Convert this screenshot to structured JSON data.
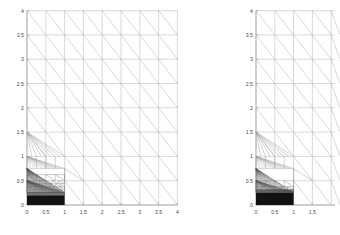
{
  "figure": {
    "kind": "mesh-plot-pair",
    "background": "#ffffff",
    "axis_color": "#8c8c8c",
    "mesh_color": "#b0b0b0",
    "refined_color": "#121212"
  },
  "chart_data": [
    {
      "id": "left",
      "type": "line",
      "title": "",
      "xlabel": "",
      "ylabel": "",
      "xlim": [
        0,
        4
      ],
      "ylim": [
        0,
        4
      ],
      "xticks": [
        0,
        0.5,
        1,
        1.5,
        2,
        2.5,
        3,
        3.5,
        4
      ],
      "xticklabels": [
        "0",
        "0.5",
        "1",
        "1.5",
        "2",
        "2.5",
        "3",
        "3.5",
        "4"
      ],
      "yticks": [
        0,
        0.5,
        1,
        1.5,
        2,
        2.5,
        3,
        3.5,
        4
      ],
      "yticklabels": [
        "0",
        "0.5",
        "1",
        "1.5",
        "2",
        "2.5",
        "3",
        "3.5",
        "4"
      ],
      "grid": false,
      "legend": "none",
      "description": "Adaptively refined triangular finite-element mesh on the square [0,4]x[0,4]. Uniform 0.5x0.5 triangulation with one diagonal per cell away from the boundary layer; strong anisotropic refinement concentrated in the strip 0<=x<=1, 0<=y<=0.75 where element layers accumulate toward y=0 and appear solid black.",
      "coarse_cell": 0.5,
      "diagonal_direction": "top-left to bottom-right",
      "refinement_region": {
        "x": [
          0,
          1
        ],
        "y": [
          0,
          0.75
        ]
      },
      "fan_vertices": [
        [
          0,
          1.5
        ],
        [
          0,
          1.0
        ],
        [
          0,
          0.75
        ]
      ],
      "layer_y_values": [
        0.75,
        0.625,
        0.5,
        0.4375,
        0.375,
        0.3125,
        0.25,
        0.1875,
        0.125,
        0.0625,
        0.03125,
        0.0156,
        0.0078,
        0
      ],
      "solid_band_y": [
        0,
        0.2
      ],
      "refinement_levels": 11
    },
    {
      "id": "right",
      "type": "line",
      "title": "",
      "xlabel": "",
      "ylabel": "",
      "xlim": [
        0,
        2.1
      ],
      "ylim": [
        0,
        4
      ],
      "xticks": [
        0,
        0.5,
        1,
        1.5
      ],
      "xticklabels": [
        "0",
        "0.5",
        "1",
        "1.5"
      ],
      "yticks": [
        0,
        0.5,
        1,
        1.5,
        2,
        2.5,
        3,
        3.5,
        4
      ],
      "yticklabels": [
        "0",
        "0.5",
        "1",
        "1.5",
        "2",
        "2.5",
        "3",
        "3.5",
        "4"
      ],
      "grid": false,
      "legend": "none",
      "description": "Second adaptively refined triangular mesh, same domain and coarse 0.5x0.5 triangulation, clipped by the figure edge near x=2.1. Boundary-layer refinement in 0<=x<=1 is one level coarser than the left panel: layers accumulate toward y=0 with a solid black band below y~0.25.",
      "coarse_cell": 0.5,
      "diagonal_direction": "top-left to bottom-right",
      "refinement_region": {
        "x": [
          0,
          1
        ],
        "y": [
          0,
          0.75
        ]
      },
      "fan_vertices": [
        [
          0,
          1.5
        ],
        [
          0,
          1.0
        ],
        [
          0,
          0.75
        ]
      ],
      "layer_y_values": [
        0.75,
        0.5,
        0.375,
        0.3125,
        0.25,
        0.1875,
        0.125,
        0.0625,
        0.03125,
        0
      ],
      "solid_band_y": [
        0,
        0.25
      ],
      "refinement_levels": 9
    }
  ]
}
